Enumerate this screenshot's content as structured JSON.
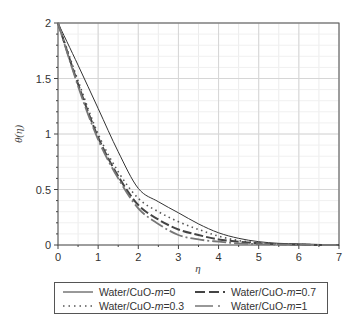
{
  "chart_data": {
    "type": "line",
    "title": "",
    "xlabel": "η",
    "ylabel": "θ(η)",
    "xlim": [
      0,
      7
    ],
    "ylim": [
      0,
      2
    ],
    "grid": true,
    "legend_position": "bottom",
    "x_ticks": [
      "0",
      "1",
      "2",
      "3",
      "4",
      "5",
      "6",
      "7"
    ],
    "y_ticks": [
      "0",
      "0.5",
      "1",
      "1.5",
      "2"
    ],
    "x": [
      0,
      0.5,
      1,
      1.5,
      2,
      2.5,
      3,
      3.5,
      4,
      4.5,
      5,
      5.5,
      6,
      6.5,
      7
    ],
    "series": [
      {
        "name": "Water/CuO-m=0",
        "style": "solid",
        "color": "#333333",
        "values": [
          2.0,
          1.62,
          1.23,
          0.84,
          0.51,
          0.39,
          0.29,
          0.19,
          0.11,
          0.06,
          0.03,
          0.015,
          0.01,
          0.005,
          0.0
        ]
      },
      {
        "name": "Water/CuO-m=0.3",
        "style": "dotted",
        "color": "#555555",
        "values": [
          2.0,
          1.48,
          1.0,
          0.66,
          0.42,
          0.3,
          0.21,
          0.14,
          0.08,
          0.04,
          0.02,
          0.01,
          0.005,
          0.0,
          0.0
        ]
      },
      {
        "name": "Water/CuO-m=0.7",
        "style": "dashed",
        "color": "#444444",
        "values": [
          2.0,
          1.45,
          0.97,
          0.62,
          0.36,
          0.23,
          0.14,
          0.09,
          0.05,
          0.03,
          0.015,
          0.008,
          0.004,
          0.0,
          0.0
        ]
      },
      {
        "name": "Water/CuO-m=1",
        "style": "dash-dot",
        "color": "#777777",
        "values": [
          2.0,
          1.43,
          0.95,
          0.6,
          0.33,
          0.19,
          0.09,
          0.05,
          0.03,
          0.015,
          0.008,
          0.004,
          0.002,
          0.0,
          0.0
        ]
      }
    ]
  },
  "legend": {
    "items": [
      {
        "prefix": "Water/CuO-",
        "var": "m",
        "suffix": "=0"
      },
      {
        "prefix": "Water/CuO-",
        "var": "m",
        "suffix": "=0.7"
      },
      {
        "prefix": "Water/CuO-",
        "var": "m",
        "suffix": "=0.3"
      },
      {
        "prefix": "Water/CuO-",
        "var": "m",
        "suffix": "=1"
      }
    ]
  }
}
